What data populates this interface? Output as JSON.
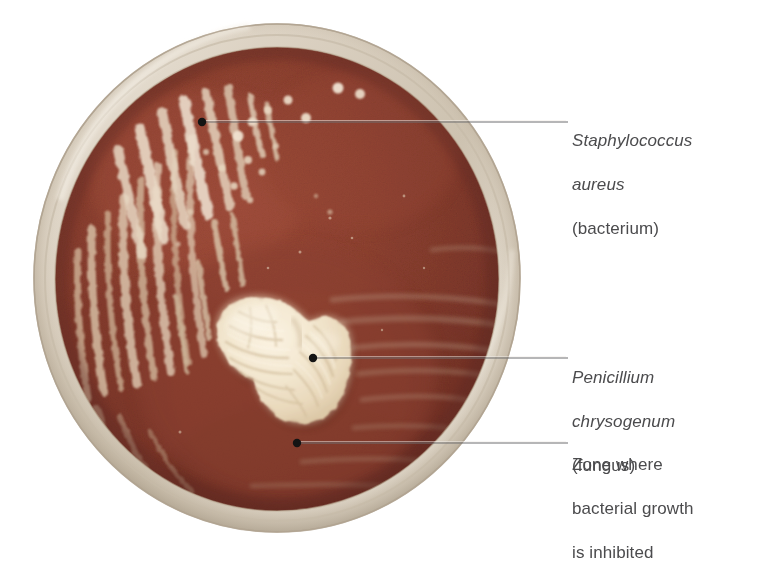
{
  "figure": {
    "type": "annotated-photograph",
    "background_color": "#ffffff"
  },
  "dish": {
    "name": "petri-dish",
    "rim_color": "#d9cfc0",
    "rim_highlight": "#efe8dd",
    "agar_color": "#8e4031",
    "agar_dark": "#6f2f26",
    "agar_light": "#a25141",
    "colony_color": "#f2e6cf",
    "colony_shadow": "#d9c7a6",
    "center_x": 277,
    "center_y": 278,
    "radius": 245
  },
  "annotations": [
    {
      "id": "staphylococcus-aureus",
      "lines": [
        {
          "text": "Staphylococcus",
          "style": "italic"
        },
        {
          "text": "aureus",
          "style": "italic"
        },
        {
          "text": "(bacterium)",
          "style": "plain"
        }
      ],
      "leader": {
        "dot_x": 202,
        "dot_y": 122,
        "end_x": 568,
        "end_y": 122
      }
    },
    {
      "id": "penicillium-chrysogenum",
      "lines": [
        {
          "text": "Penicillium",
          "style": "italic"
        },
        {
          "text": "chrysogenum",
          "style": "italic"
        },
        {
          "text": "(fungus)",
          "style": "plain"
        }
      ],
      "leader": {
        "dot_x": 313,
        "dot_y": 358,
        "end_x": 568,
        "end_y": 358
      }
    },
    {
      "id": "inhibition-zone",
      "lines": [
        {
          "text": "Zone where",
          "style": "plain"
        },
        {
          "text": "bacterial growth",
          "style": "plain"
        },
        {
          "text": "is inhibited",
          "style": "plain"
        }
      ],
      "leader": {
        "dot_x": 297,
        "dot_y": 443,
        "end_x": 568,
        "end_y": 443
      }
    }
  ],
  "labels": {
    "staphylococcus": {
      "line1": "Staphylococcus",
      "line2": "aureus",
      "line3": "(bacterium)"
    },
    "penicillium": {
      "line1": "Penicillium",
      "line2": "chrysogenum",
      "line3": "(fungus)"
    },
    "zone": {
      "line1": "Zone where",
      "line2": "bacterial growth",
      "line3": "is inhibited"
    }
  },
  "style": {
    "label_color": "#4b4b4d",
    "leader_color": "#6e6e70",
    "dot_color": "#1a1a1a",
    "label_font_size": "17px"
  }
}
